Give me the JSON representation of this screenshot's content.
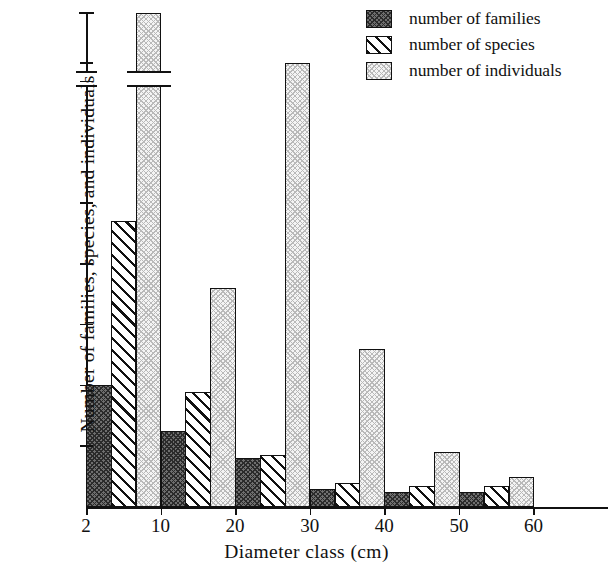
{
  "chart_data": {
    "type": "bar",
    "title": "",
    "xlabel": "Diameter class (cm)",
    "ylabel": "Number of families, species, and individuals",
    "grid": false,
    "legend_position": "top-right",
    "x_tick_labels": [
      "2",
      "10",
      "20",
      "30",
      "40",
      "50",
      "60"
    ],
    "y_tick_labels": [
      "10",
      "20",
      "30",
      "40",
      "50",
      "70",
      "73",
      "298"
    ],
    "y_tick_values": [
      10,
      20,
      30,
      40,
      50,
      70,
      73,
      298
    ],
    "ylim": [
      0,
      298
    ],
    "axis_break": {
      "from": 80,
      "to": 290
    },
    "categories": [
      "2-10",
      "10-20",
      "20-30",
      "30-40",
      "40-50",
      "50-60",
      "60+"
    ],
    "series": [
      {
        "name": "number of families",
        "pattern": "checkered-dark",
        "color": "#6f6f6f",
        "values": [
          20,
          12.5,
          8,
          3,
          2.5,
          2.5,
          0
        ]
      },
      {
        "name": "number of species",
        "pattern": "diagonal-hatch",
        "color": "#ffffff",
        "values": [
          47,
          19,
          8.5,
          4,
          3.5,
          3.5,
          0
        ]
      },
      {
        "name": "number of individuals",
        "pattern": "dotted-light",
        "color": "#f4f4f4",
        "values": [
          298,
          36,
          73,
          26,
          9,
          5,
          0
        ]
      }
    ]
  },
  "legend": {
    "items": [
      {
        "label": "number of families",
        "swatch": "fill-families"
      },
      {
        "label": "number of species",
        "swatch": "fill-species"
      },
      {
        "label": "number of individuals",
        "swatch": "fill-individuals"
      }
    ]
  },
  "axes": {
    "y_title": "Number of families, species, and individuals",
    "x_title": "Diameter class (cm)",
    "y_ticks": [
      {
        "label": "10",
        "value": 10
      },
      {
        "label": "20",
        "value": 20
      },
      {
        "label": "30",
        "value": 30
      },
      {
        "label": "40",
        "value": 40
      },
      {
        "label": "50",
        "value": 50
      },
      {
        "label": "70",
        "value": 70
      },
      {
        "label": "73",
        "value": 73
      },
      {
        "label": "298",
        "value": 298
      }
    ],
    "x_ticks": [
      {
        "label": "2",
        "value": 2
      },
      {
        "label": "10",
        "value": 10
      },
      {
        "label": "20",
        "value": 20
      },
      {
        "label": "30",
        "value": 30
      },
      {
        "label": "40",
        "value": 40
      },
      {
        "label": "50",
        "value": 50
      },
      {
        "label": "60",
        "value": 60
      }
    ]
  }
}
